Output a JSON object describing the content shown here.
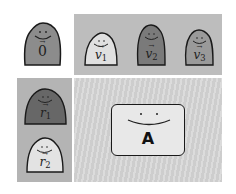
{
  "diagram": {
    "type": "matrix-vector illustration",
    "zero_vector": {
      "name": "0",
      "arrow": true,
      "fill": "#8c8c8c"
    },
    "column_vectors": [
      {
        "name": "v",
        "sub": "1",
        "fill": "#e0e0e0"
      },
      {
        "name": "v",
        "sub": "2",
        "fill": "#7a7a7a"
      },
      {
        "name": "v",
        "sub": "3",
        "fill": "#9a9a9a"
      }
    ],
    "row_vectors": [
      {
        "name": "r",
        "sub": "1",
        "fill": "#676767"
      },
      {
        "name": "r",
        "sub": "2",
        "fill": "#e3e3e3"
      }
    ],
    "matrix": {
      "label": "A",
      "fill": "#e8e8e8"
    },
    "colors": {
      "top_panel": "#bdbdbd",
      "left_panel": "#b4b4b4",
      "main_panel": "#d4d4d4",
      "outline": "#1a1a1a"
    }
  }
}
